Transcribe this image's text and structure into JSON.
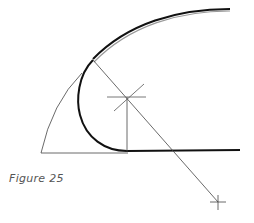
{
  "figure": {
    "caption": "Figure 25",
    "colors": {
      "thick_stroke": "#111111",
      "thin_stroke": "#444444",
      "caption_text": "#555555",
      "background": "#ffffff"
    }
  },
  "geometry": {
    "baseline": {
      "x1": 41,
      "y1": 153,
      "x2": 127,
      "y2": 153
    },
    "thick_tangent_line": {
      "x1": 127,
      "y1": 151,
      "x2": 240,
      "y2": 150
    },
    "construction_arc": {
      "start": [
        41,
        153
      ],
      "end": [
        82,
        73
      ]
    },
    "thick_curve": {
      "start": [
        230,
        9
      ],
      "tangent_point": [
        93,
        60
      ],
      "leftmost": [
        78,
        100
      ],
      "end": [
        127,
        151
      ]
    },
    "vertical_line": {
      "x1": 127,
      "y1": 97,
      "x2": 127,
      "y2": 151
    },
    "diagonal_line": {
      "x1": 93,
      "y1": 60,
      "x2": 218,
      "y2": 202
    },
    "star_center": [
      127,
      97
    ],
    "cross_center": [
      218,
      202
    ]
  }
}
